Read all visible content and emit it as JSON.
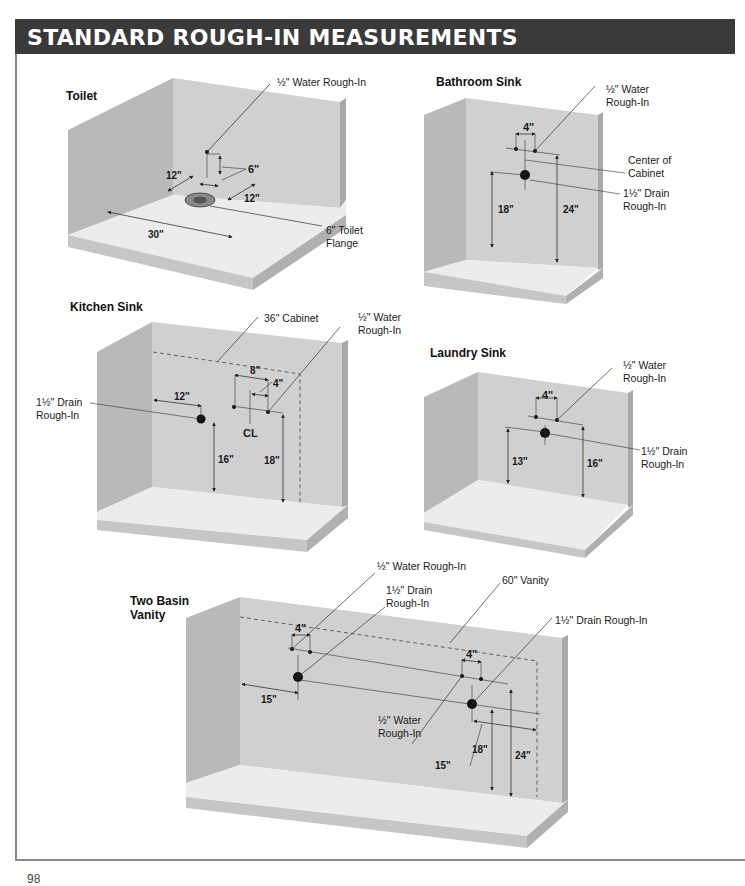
{
  "page": {
    "title": "STANDARD ROUGH-IN MEASUREMENTS",
    "page_number": "98"
  },
  "colors": {
    "title_bar": "#3a3a3a",
    "title_text": "#ffffff",
    "wall_back": "#cfcfcf",
    "wall_side": "#b8b8b8",
    "floor": "#ececec",
    "floor_edge": "#c4c4c4",
    "frame_border": "#8a8a8a"
  },
  "diagrams": {
    "toilet": {
      "heading": "Toilet",
      "labels": {
        "water": "½\" Water Rough-In",
        "flange_line1": "6\" Toilet",
        "flange_line2": "Flange"
      },
      "dimensions": {
        "water_height": "6\"",
        "wall_to_flange": "12\"",
        "side_offset": "12\"",
        "wall_width": "30\""
      }
    },
    "bathroom_sink": {
      "heading": "Bathroom Sink",
      "labels": {
        "water_line1": "½\" Water",
        "water_line2": "Rough-In",
        "center_line1": "Center of",
        "center_line2": "Cabinet",
        "drain_line1": "1½\" Drain",
        "drain_line2": "Rough-In"
      },
      "dimensions": {
        "water_spacing": "4\"",
        "drain_height": "18\"",
        "water_height": "24\""
      }
    },
    "kitchen_sink": {
      "heading": "Kitchen Sink",
      "labels": {
        "cabinet": "36\" Cabinet",
        "water_line1": "½\" Water",
        "water_line2": "Rough-In",
        "drain_line1": "1½\" Drain",
        "drain_line2": "Rough-In",
        "centerline": "CL"
      },
      "dimensions": {
        "water_spacing": "8\"",
        "half_spacing": "4\"",
        "drain_offset": "12\"",
        "drain_height": "16\"",
        "water_height": "18\""
      }
    },
    "laundry_sink": {
      "heading": "Laundry Sink",
      "labels": {
        "water_line1": "½\" Water",
        "water_line2": "Rough-In",
        "drain_line1": "1½\" Drain",
        "drain_line2": "Rough-In"
      },
      "dimensions": {
        "water_spacing": "4\"",
        "drain_height": "13\"",
        "water_height": "16\""
      }
    },
    "two_basin_vanity": {
      "heading_line1": "Two Basin",
      "heading_line2": "Vanity",
      "labels": {
        "water_top": "½\" Water Rough-In",
        "drain_left_line1": "1½\" Drain",
        "drain_left_line2": "Rough-In",
        "vanity": "60\" Vanity",
        "drain_right": "1½\" Drain Rough-In",
        "water_bottom_line1": "½\" Water",
        "water_bottom_line2": "Rough-In"
      },
      "dimensions": {
        "left_water_spacing": "4\"",
        "right_water_spacing": "4\"",
        "left_offset": "15\"",
        "right_offset": "15\"",
        "drain_height": "18\"",
        "water_height": "24\""
      }
    }
  }
}
